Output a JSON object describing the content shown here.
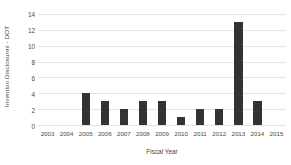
{
  "chart_data": {
    "type": "bar",
    "title": "",
    "subtitle": "",
    "xlabel": "Fiscal Year",
    "ylabel": "Invention Disclosures - DOT",
    "categories": [
      "2003",
      "2004",
      "2005",
      "2006",
      "2007",
      "2008",
      "2009",
      "2010",
      "2011",
      "2012",
      "2013",
      "2014",
      "2015"
    ],
    "values": [
      0,
      0,
      4,
      3,
      2,
      3,
      3,
      1,
      2,
      2,
      13,
      3,
      0
    ],
    "ylim": [
      0,
      14
    ],
    "yticks": [
      0,
      2,
      4,
      6,
      8,
      10,
      12,
      14
    ],
    "ytick_labels": [
      "0",
      "2",
      "4",
      "6",
      "8",
      "10",
      "12",
      "14"
    ],
    "grid": true,
    "grid_axis": "y",
    "legend": false,
    "legend_position": "none",
    "bar_color": "#333333",
    "gridline_color": "#e3e3e3",
    "axis_color": "#d9d9d9",
    "background_color": "#ffffff",
    "text_color": "#4a4a4a"
  }
}
